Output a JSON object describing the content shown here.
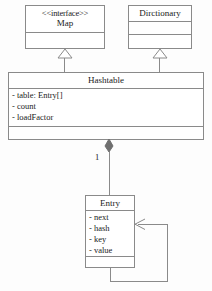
{
  "diagram": {
    "type": "uml-class-diagram",
    "width": 212,
    "height": 291,
    "background_color": "#fdfdfd",
    "line_color": "#8a8a8a",
    "text_color": "#1a1a1a"
  },
  "classes": {
    "map": {
      "stereotype": "<<interface>>",
      "name": "Map",
      "attributes": [],
      "operations": []
    },
    "dictionary": {
      "name": "Dirctionary",
      "attributes": [],
      "operations": []
    },
    "hashtable": {
      "name": "Hashtable",
      "attributes": [
        "- table: Entry[]",
        "- count",
        "- loadFactor"
      ],
      "operations": []
    },
    "entry": {
      "name": "Entry",
      "attributes": [
        "- next",
        "- hash",
        "- key",
        "- value"
      ],
      "operations": []
    }
  },
  "relationships": {
    "hashtable_implements_map": {
      "kind": "generalization",
      "from": "hashtable",
      "to": "map",
      "arrow": "hollow-triangle"
    },
    "hashtable_extends_dictionary": {
      "kind": "generalization",
      "from": "hashtable",
      "to": "dictionary",
      "arrow": "hollow-triangle"
    },
    "hashtable_composes_entry": {
      "kind": "composition",
      "from": "hashtable",
      "to": "entry",
      "arrow": "filled-diamond",
      "multiplicity_source": "1"
    },
    "entry_next_entry": {
      "kind": "association",
      "from": "entry",
      "to": "entry",
      "arrow": "open-arrow",
      "self_reference": true
    }
  }
}
